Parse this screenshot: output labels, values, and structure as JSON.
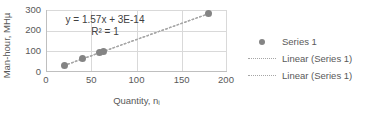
{
  "chart_data": {
    "type": "scatter",
    "title": "",
    "xlabel": "Quantity, nᵢ",
    "ylabel": "Man-hour, MHµ",
    "xlim": [
      0,
      200
    ],
    "ylim": [
      0,
      300
    ],
    "x_ticks": [
      "0",
      "50",
      "100",
      "150",
      "200"
    ],
    "x_tick_values": [
      0,
      50,
      100,
      150,
      200
    ],
    "y_ticks": [
      "0",
      "100",
      "200",
      "300"
    ],
    "y_tick_values": [
      0,
      100,
      200,
      300
    ],
    "grid": true,
    "legend_position": "right",
    "series": [
      {
        "name": "Series 1",
        "type": "scatter",
        "marker": "circle",
        "color": "#848484",
        "x": [
          20,
          40,
          59,
          63,
          180
        ],
        "y": [
          31,
          63,
          93,
          99,
          283
        ]
      },
      {
        "name": "Linear (Series 1)",
        "type": "line",
        "style": "dotted",
        "color": "#a6a6a6",
        "slope": 1.57,
        "intercept": 0,
        "x": [
          20,
          180
        ],
        "y": [
          31.4,
          282.6
        ]
      },
      {
        "name": "Linear (Series 1)",
        "type": "line",
        "style": "dotted",
        "color": "#a6a6a6",
        "slope": 1.57,
        "intercept": 0,
        "x": [
          20,
          180
        ],
        "y": [
          31.4,
          282.6
        ]
      }
    ],
    "annotations": {
      "equation": "y = 1.57x + 3E-14",
      "r_squared": "R² = 1"
    }
  },
  "axes": {
    "y_title": "Man-hour, MHµ",
    "x_title": "Quantity, nᵢ",
    "y_tick_labels": [
      "300",
      "200",
      "100",
      "0"
    ],
    "x_tick_labels": [
      "0",
      "50",
      "100",
      "150",
      "200"
    ]
  },
  "annotation": {
    "equation_line1": "y = 1.57x + 3E-14",
    "equation_line2": "R² = 1"
  },
  "legend": {
    "items": [
      {
        "label": "Series 1",
        "key": "marker-dot"
      },
      {
        "label": "Linear (Series 1)",
        "key": "dotted-line"
      },
      {
        "label": "Linear (Series 1)",
        "key": "dotted-line"
      }
    ]
  },
  "colors": {
    "marker": "#848484",
    "trendline": "#a6a6a6",
    "gridline": "#d9d9d9",
    "axis": "#bfbfbf",
    "text": "#595959",
    "background": "#ffffff"
  }
}
